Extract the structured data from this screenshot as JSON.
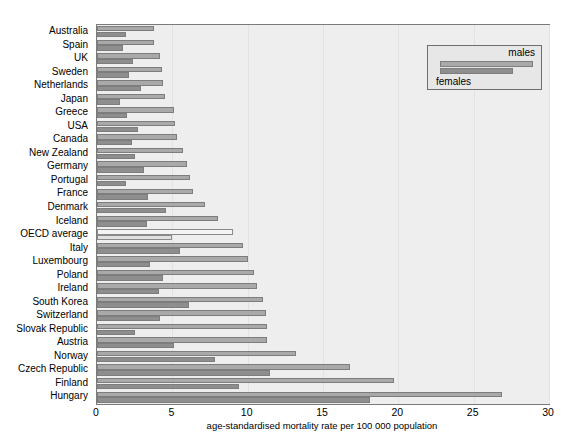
{
  "chart_data": {
    "type": "bar",
    "orientation": "horizontal",
    "title": "",
    "subtitle": "",
    "xlabel": "age-standardised mortality rate per 100 000 population",
    "ylabel": "",
    "xlim": [
      0,
      30
    ],
    "xticks": [
      0,
      5,
      10,
      15,
      20,
      25,
      30
    ],
    "xtick_labels": [
      "0",
      "5",
      "10",
      "15",
      "20",
      "25",
      "30"
    ],
    "grid": true,
    "grid_axis": "x",
    "legend_position": "top-right",
    "legend": [
      "males",
      "females"
    ],
    "categories": [
      "Australia",
      "Spain",
      "UK",
      "Sweden",
      "Netherlands",
      "Japan",
      "Greece",
      "USA",
      "Canada",
      "New Zealand",
      "Germany",
      "Portugal",
      "France",
      "Denmark",
      "Iceland",
      "OECD average",
      "Italy",
      "Luxembourg",
      "Poland",
      "Ireland",
      "South Korea",
      "Switzerland",
      "Slovak Republic",
      "Austria",
      "Norway",
      "Czech Republic",
      "Finland",
      "Hungary"
    ],
    "highlight_category": "OECD average",
    "series": [
      {
        "name": "males",
        "color": "#a9a9a9",
        "values": [
          3.8,
          3.8,
          4.2,
          4.3,
          4.4,
          4.5,
          5.1,
          5.2,
          5.3,
          5.7,
          6.0,
          6.2,
          6.4,
          7.2,
          8.0,
          9.0,
          9.7,
          10.0,
          10.4,
          10.6,
          11.0,
          11.2,
          11.3,
          11.3,
          13.2,
          16.8,
          19.7,
          26.9
        ]
      },
      {
        "name": "females",
        "color": "#8e8e8e",
        "values": [
          1.9,
          1.7,
          2.4,
          2.1,
          2.9,
          1.5,
          2.0,
          2.7,
          2.3,
          2.5,
          3.1,
          1.9,
          3.4,
          4.6,
          3.3,
          5.0,
          5.5,
          3.5,
          4.4,
          4.1,
          6.1,
          4.2,
          2.5,
          5.1,
          7.8,
          11.5,
          9.4,
          18.1
        ]
      }
    ]
  },
  "axis": {
    "x_title": "age-standardised mortality rate per 100 000 population"
  },
  "legend": {
    "males_label": "males",
    "females_label": "females"
  }
}
